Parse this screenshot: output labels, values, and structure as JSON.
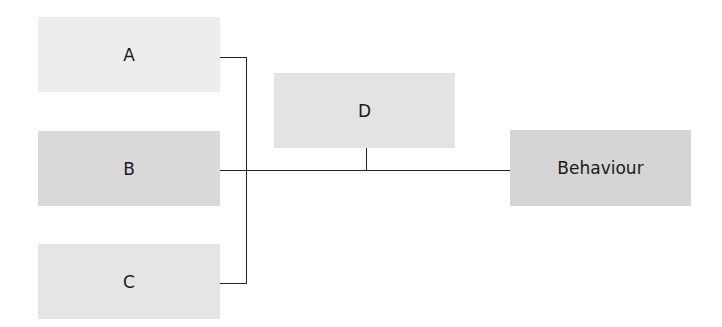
{
  "diagram": {
    "nodes": [
      {
        "id": "A",
        "label": "A",
        "color": "#ededed"
      },
      {
        "id": "B",
        "label": "B",
        "color": "#d9d9d9"
      },
      {
        "id": "C",
        "label": "C",
        "color": "#e5e5e5"
      },
      {
        "id": "D",
        "label": "D",
        "color": "#e3e3e3"
      },
      {
        "id": "Behaviour",
        "label": "Behaviour",
        "color": "#d5d5d5"
      }
    ],
    "edges": [
      {
        "from": "A",
        "to": "Behaviour"
      },
      {
        "from": "B",
        "to": "Behaviour"
      },
      {
        "from": "C",
        "to": "Behaviour"
      },
      {
        "from": "D",
        "to": "Behaviour",
        "type": "moderator"
      }
    ]
  }
}
